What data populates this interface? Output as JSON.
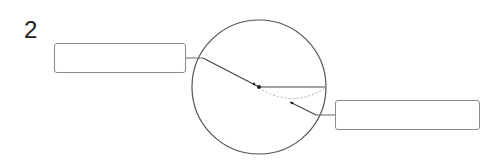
{
  "question_number": "2",
  "diagram": {
    "label_boxes": [
      {
        "id": "left",
        "text": ""
      },
      {
        "id": "right",
        "text": ""
      }
    ],
    "colors": {
      "stroke": "#555555",
      "dashed": "#b0b0b0",
      "box_border": "#8a8a8a"
    }
  }
}
